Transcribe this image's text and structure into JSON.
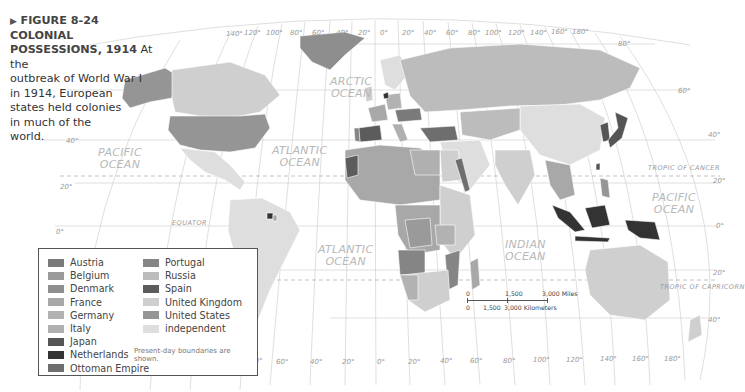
{
  "figure": {
    "marker": "▶",
    "number": "FIGURE 8-24",
    "title": "COLONIAL POSSESSIONS, 1914",
    "title_line1": "COLONIAL",
    "title_line2": "POSSESSIONS, 1914",
    "text_line1": "At the",
    "text_line2": "outbreak of World War I",
    "text_line3": "in 1914, European",
    "text_line4": "states held colonies",
    "text_line5": "in much of the",
    "text_line6": "world."
  },
  "legend": {
    "items": [
      {
        "label": "Austria",
        "color": "#7a7a7a"
      },
      {
        "label": "Belgium",
        "color": "#9a9a9a"
      },
      {
        "label": "Denmark",
        "color": "#8e8e8e"
      },
      {
        "label": "France",
        "color": "#a8a8a8"
      },
      {
        "label": "Germany",
        "color": "#b2b2b2"
      },
      {
        "label": "Italy",
        "color": "#b0b0b0"
      },
      {
        "label": "Japan",
        "color": "#555555"
      },
      {
        "label": "Netherlands",
        "color": "#333333"
      },
      {
        "label": "Ottoman Empire",
        "color": "#6e6e6e"
      },
      {
        "label": "Portugal",
        "color": "#858585"
      },
      {
        "label": "Russia",
        "color": "#bcbcbc"
      },
      {
        "label": "Spain",
        "color": "#5c5c5c"
      },
      {
        "label": "United Kingdom",
        "color": "#cfcfcf"
      },
      {
        "label": "United States",
        "color": "#959595"
      },
      {
        "label": "independent",
        "color": "#dedede"
      }
    ],
    "note": "Present-day boundaries are shown."
  },
  "oceans": {
    "arctic": [
      "ARCTIC",
      "OCEAN"
    ],
    "pacific_west": [
      "PACIFIC",
      "OCEAN"
    ],
    "atlantic_north": [
      "ATLANTIC",
      "OCEAN"
    ],
    "atlantic_south": [
      "ATLANTIC",
      "OCEAN"
    ],
    "indian": [
      "INDIAN",
      "OCEAN"
    ],
    "pacific_east": [
      "PACIFIC",
      "OCEAN"
    ]
  },
  "lines": {
    "tropic_cancer": "TROPIC OF CANCER",
    "tropic_capricorn": "TROPIC OF CAPRICORN",
    "equator": "EQUATOR"
  },
  "graticule": {
    "top_longitudes": [
      "140°",
      "120°",
      "100°",
      "80°",
      "60°",
      "40°",
      "20°",
      "0°",
      "20°",
      "40°",
      "60°",
      "80°",
      "100°",
      "120°",
      "140°",
      "160°",
      "180°"
    ],
    "bottom_longitudes": [
      "80°",
      "60°",
      "40°",
      "20°",
      "0°",
      "20°",
      "40°",
      "60°",
      "80°",
      "100°",
      "120°",
      "140°",
      "160°",
      "180°"
    ],
    "left_latitudes": [
      "40°",
      "20°",
      "0°"
    ],
    "right_latitudes": [
      "80°",
      "60°",
      "40°",
      "20°",
      "0°",
      "20°",
      "40°"
    ]
  },
  "scale": {
    "miles_0": "0",
    "miles_mid": "1,500",
    "miles_end": "3,000 Miles",
    "km_0": "0",
    "km_mid": "1,500",
    "km_end": "3,000 Kilometers"
  }
}
